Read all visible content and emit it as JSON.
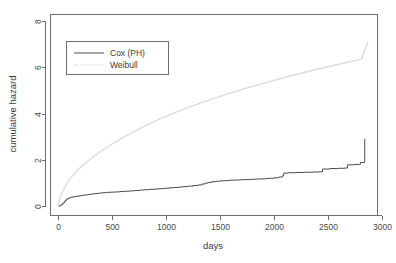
{
  "chart_data": {
    "type": "line",
    "title": "",
    "xlabel": "days",
    "ylabel": "cumulative hazard",
    "xlim": [
      -120,
      3090
    ],
    "ylim": [
      -0.35,
      8.7
    ],
    "xticks": [
      0,
      500,
      1000,
      1500,
      2000,
      2500,
      3000
    ],
    "xtick_labels": [
      "0",
      "500",
      "1000",
      "1500",
      "2000",
      "2500",
      "3000"
    ],
    "yticks": [
      0,
      2,
      4,
      6,
      8
    ],
    "ytick_labels": [
      "0",
      "2",
      "4",
      "6",
      "8"
    ],
    "grid": false,
    "legend_position": "upper left",
    "series": [
      {
        "name": "Cox (PH)",
        "style": "step",
        "color": "#4d4d4d",
        "dash": "solid",
        "points": [
          [
            0,
            0.0
          ],
          [
            18,
            0.02
          ],
          [
            30,
            0.06
          ],
          [
            45,
            0.13
          ],
          [
            58,
            0.2
          ],
          [
            70,
            0.26
          ],
          [
            85,
            0.31
          ],
          [
            100,
            0.35
          ],
          [
            120,
            0.38
          ],
          [
            140,
            0.4
          ],
          [
            165,
            0.42
          ],
          [
            190,
            0.44
          ],
          [
            215,
            0.46
          ],
          [
            245,
            0.48
          ],
          [
            275,
            0.5
          ],
          [
            305,
            0.52
          ],
          [
            340,
            0.54
          ],
          [
            375,
            0.56
          ],
          [
            410,
            0.575
          ],
          [
            450,
            0.59
          ],
          [
            490,
            0.6
          ],
          [
            530,
            0.61
          ],
          [
            575,
            0.625
          ],
          [
            620,
            0.64
          ],
          [
            665,
            0.655
          ],
          [
            710,
            0.67
          ],
          [
            755,
            0.69
          ],
          [
            800,
            0.705
          ],
          [
            845,
            0.72
          ],
          [
            890,
            0.735
          ],
          [
            935,
            0.75
          ],
          [
            980,
            0.765
          ],
          [
            1025,
            0.785
          ],
          [
            1070,
            0.8
          ],
          [
            1115,
            0.82
          ],
          [
            1160,
            0.84
          ],
          [
            1205,
            0.86
          ],
          [
            1250,
            0.885
          ],
          [
            1295,
            0.91
          ],
          [
            1330,
            0.95
          ],
          [
            1360,
            0.99
          ],
          [
            1390,
            1.02
          ],
          [
            1425,
            1.05
          ],
          [
            1465,
            1.07
          ],
          [
            1505,
            1.09
          ],
          [
            1545,
            1.1
          ],
          [
            1590,
            1.115
          ],
          [
            1635,
            1.125
          ],
          [
            1680,
            1.135
          ],
          [
            1730,
            1.145
          ],
          [
            1780,
            1.155
          ],
          [
            1830,
            1.165
          ],
          [
            1880,
            1.175
          ],
          [
            1925,
            1.19
          ],
          [
            1960,
            1.2
          ],
          [
            2000,
            1.22
          ],
          [
            2040,
            1.25
          ],
          [
            2075,
            1.3
          ],
          [
            2090,
            1.42
          ],
          [
            2130,
            1.44
          ],
          [
            2200,
            1.45
          ],
          [
            2280,
            1.46
          ],
          [
            2360,
            1.47
          ],
          [
            2420,
            1.48
          ],
          [
            2450,
            1.6
          ],
          [
            2520,
            1.62
          ],
          [
            2590,
            1.63
          ],
          [
            2650,
            1.64
          ],
          [
            2680,
            1.78
          ],
          [
            2740,
            1.8
          ],
          [
            2800,
            1.88
          ],
          [
            2838,
            1.9
          ],
          [
            2840,
            2.9
          ]
        ]
      },
      {
        "name": "Weibull",
        "style": "smooth",
        "color": "#dcdcdc",
        "dash": "dotted",
        "points": [
          [
            0,
            0.0
          ],
          [
            20,
            0.38
          ],
          [
            45,
            0.66
          ],
          [
            75,
            0.92
          ],
          [
            110,
            1.16
          ],
          [
            150,
            1.39
          ],
          [
            200,
            1.63
          ],
          [
            260,
            1.88
          ],
          [
            330,
            2.14
          ],
          [
            410,
            2.41
          ],
          [
            500,
            2.68
          ],
          [
            600,
            2.96
          ],
          [
            710,
            3.24
          ],
          [
            830,
            3.52
          ],
          [
            960,
            3.8
          ],
          [
            1100,
            4.07
          ],
          [
            1250,
            4.34
          ],
          [
            1410,
            4.6
          ],
          [
            1580,
            4.86
          ],
          [
            1760,
            5.12
          ],
          [
            1950,
            5.37
          ],
          [
            2150,
            5.62
          ],
          [
            2360,
            5.87
          ],
          [
            2580,
            6.11
          ],
          [
            2810,
            6.35
          ],
          [
            2870,
            7.1
          ]
        ]
      }
    ],
    "legend_entries": [
      {
        "label": "Cox (PH)",
        "color": "#4d4d4d",
        "dash": "solid"
      },
      {
        "label": "Weibull",
        "color": "#d8d8d8",
        "dash": "dotted"
      }
    ]
  }
}
